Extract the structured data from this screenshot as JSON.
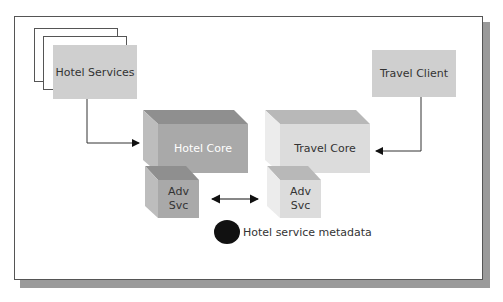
{
  "header_fragment": "...and deploy...",
  "diagram": {
    "nodes": {
      "hotel_services": {
        "label": "Hotel Services",
        "color": "#cfcfcf"
      },
      "travel_client": {
        "label": "Travel Client",
        "color": "#cfcfcf"
      },
      "hotel_core": {
        "label": "Hotel Core",
        "front": "#a9a9a9",
        "top": "#8f8f8f",
        "side": "#bdbdbd",
        "text_color": "#ffffff"
      },
      "travel_core": {
        "label": "Travel Core",
        "front": "#dcdcdc",
        "top": "#b8b8b8",
        "side": "#ececec",
        "text_color": "#333333"
      },
      "hotel_adv_svc": {
        "line1": "Adv",
        "line2": "Svc",
        "front": "#a9a9a9",
        "top": "#8f8f8f",
        "side": "#bdbdbd"
      },
      "travel_adv_svc": {
        "line1": "Adv",
        "line2": "Svc",
        "front": "#dcdcdc",
        "top": "#b8b8b8",
        "side": "#ececec"
      }
    },
    "edges": [
      {
        "from": "Hotel Services",
        "to": "Hotel Core",
        "type": "elbow-arrow"
      },
      {
        "from": "Travel Client",
        "to": "Travel Core",
        "type": "elbow-arrow"
      },
      {
        "from": "Hotel Adv Svc",
        "to": "Travel Adv Svc",
        "type": "bidirectional-arrow"
      }
    ],
    "legend": {
      "label": "Hotel service metadata",
      "symbol": "black-circle"
    }
  }
}
